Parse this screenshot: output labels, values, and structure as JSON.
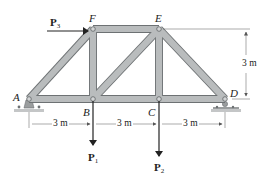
{
  "diagram": {
    "type": "planar truss",
    "colors": {
      "member_fill": "#b9bcbd",
      "member_edge": "#6d7173",
      "pin": "#8b8f91",
      "support_fill": "#9a9d9e",
      "ground": "#c4c6c7",
      "line": "#222222",
      "dimension_line": "#555555"
    },
    "joints": {
      "A": {
        "label": "A",
        "x": 29,
        "y": 99
      },
      "B": {
        "label": "B",
        "x": 93,
        "y": 99
      },
      "C": {
        "label": "C",
        "x": 159,
        "y": 99
      },
      "D": {
        "label": "D",
        "x": 225,
        "y": 99
      },
      "E": {
        "label": "E",
        "x": 159,
        "y": 29
      },
      "F": {
        "label": "F",
        "x": 93,
        "y": 29
      }
    },
    "members": [
      "AB",
      "BC",
      "CD",
      "AF",
      "FE",
      "ED",
      "FB",
      "EC",
      "BE"
    ],
    "supports": [
      {
        "joint": "A",
        "type": "pin"
      },
      {
        "joint": "D",
        "type": "roller"
      }
    ],
    "loads": [
      {
        "id": "P3",
        "label_main": "P",
        "label_sub": "3",
        "joint": "F",
        "direction": "right (horizontal)"
      },
      {
        "id": "P1",
        "label_main": "P",
        "label_sub": "1",
        "joint": "B",
        "direction": "down"
      },
      {
        "id": "P2",
        "label_main": "P",
        "label_sub": "2",
        "joint": "C",
        "direction": "down"
      }
    ],
    "dimensions": [
      {
        "label": "3 m",
        "from": "A",
        "to": "B",
        "orientation": "horizontal"
      },
      {
        "label": "3 m",
        "from": "B",
        "to": "C",
        "orientation": "horizontal"
      },
      {
        "label": "3 m",
        "from": "C",
        "to": "D",
        "orientation": "horizontal"
      },
      {
        "label": "3 m",
        "from": "D",
        "to": "E",
        "orientation": "vertical (height)"
      }
    ]
  }
}
